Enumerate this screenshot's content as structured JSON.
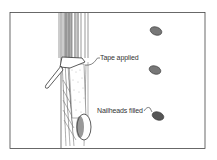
{
  "illustration": {
    "subject": "Drywall joint taping and nailhead filling",
    "labels": {
      "tape": "Tape applied",
      "nailheads": "Nailheads filled"
    },
    "colors": {
      "line": "#333333",
      "shade": "#8a8a8a",
      "background": "#ffffff"
    }
  }
}
